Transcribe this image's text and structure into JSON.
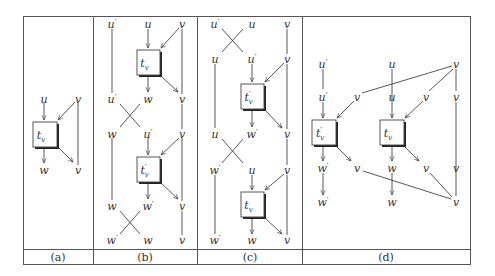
{
  "figure": {
    "panels": [
      {
        "id": "a",
        "caption": "(a)",
        "labels": [
          {
            "text": "u",
            "prime": false
          },
          {
            "text": "v",
            "prime": false
          },
          {
            "text": "w",
            "prime": false
          },
          {
            "text": "v",
            "prime": false
          }
        ],
        "boxes": [
          {
            "text": "t",
            "sub": "v",
            "prime": false
          }
        ]
      },
      {
        "id": "b",
        "caption": "(b)",
        "labels": [
          {
            "text": "u",
            "prime": true
          },
          {
            "text": "u",
            "prime": false
          },
          {
            "text": "v",
            "prime": false
          },
          {
            "text": "u",
            "prime": true
          },
          {
            "text": "w",
            "prime": false
          },
          {
            "text": "v",
            "prime": false
          },
          {
            "text": "w",
            "prime": false
          },
          {
            "text": "u",
            "prime": true
          },
          {
            "text": "v",
            "prime": false
          },
          {
            "text": "w",
            "prime": false
          },
          {
            "text": "w",
            "prime": true
          },
          {
            "text": "v",
            "prime": false
          },
          {
            "text": "w",
            "prime": true
          },
          {
            "text": "w",
            "prime": false
          },
          {
            "text": "v",
            "prime": false
          }
        ],
        "boxes": [
          {
            "text": "t",
            "sub": "v",
            "prime": false
          },
          {
            "text": "t",
            "sub": "v",
            "prime": true
          }
        ]
      },
      {
        "id": "c",
        "caption": "(c)",
        "labels": [
          {
            "text": "u",
            "prime": true
          },
          {
            "text": "u",
            "prime": false
          },
          {
            "text": "v",
            "prime": false
          },
          {
            "text": "u",
            "prime": false
          },
          {
            "text": "u",
            "prime": true
          },
          {
            "text": "v",
            "prime": false
          },
          {
            "text": "u",
            "prime": false
          },
          {
            "text": "w",
            "prime": true
          },
          {
            "text": "v",
            "prime": false
          },
          {
            "text": "w",
            "prime": true
          },
          {
            "text": "u",
            "prime": false
          },
          {
            "text": "v",
            "prime": false
          },
          {
            "text": "w",
            "prime": true
          },
          {
            "text": "w",
            "prime": false
          },
          {
            "text": "v",
            "prime": false
          }
        ],
        "boxes": [
          {
            "text": "t",
            "sub": "v",
            "prime": true
          },
          {
            "text": "t",
            "sub": "v",
            "prime": false
          }
        ]
      },
      {
        "id": "d",
        "caption": "(d)",
        "labels": [
          {
            "text": "u",
            "prime": true
          },
          {
            "text": "u",
            "prime": false
          },
          {
            "text": "v",
            "prime": false
          },
          {
            "text": "u",
            "prime": true
          },
          {
            "text": "v",
            "prime": false
          },
          {
            "text": "u",
            "prime": false
          },
          {
            "text": "v",
            "prime": false
          },
          {
            "text": "v",
            "prime": false
          },
          {
            "text": "w",
            "prime": true
          },
          {
            "text": "v",
            "prime": false
          },
          {
            "text": "w",
            "prime": false
          },
          {
            "text": "v",
            "prime": false
          },
          {
            "text": "v",
            "prime": false
          },
          {
            "text": "w",
            "prime": true
          },
          {
            "text": "w",
            "prime": false
          },
          {
            "text": "v",
            "prime": false
          }
        ],
        "boxes": [
          {
            "text": "t",
            "sub": "v",
            "prime": true
          },
          {
            "text": "t",
            "sub": "v",
            "prime": false
          }
        ]
      }
    ]
  }
}
